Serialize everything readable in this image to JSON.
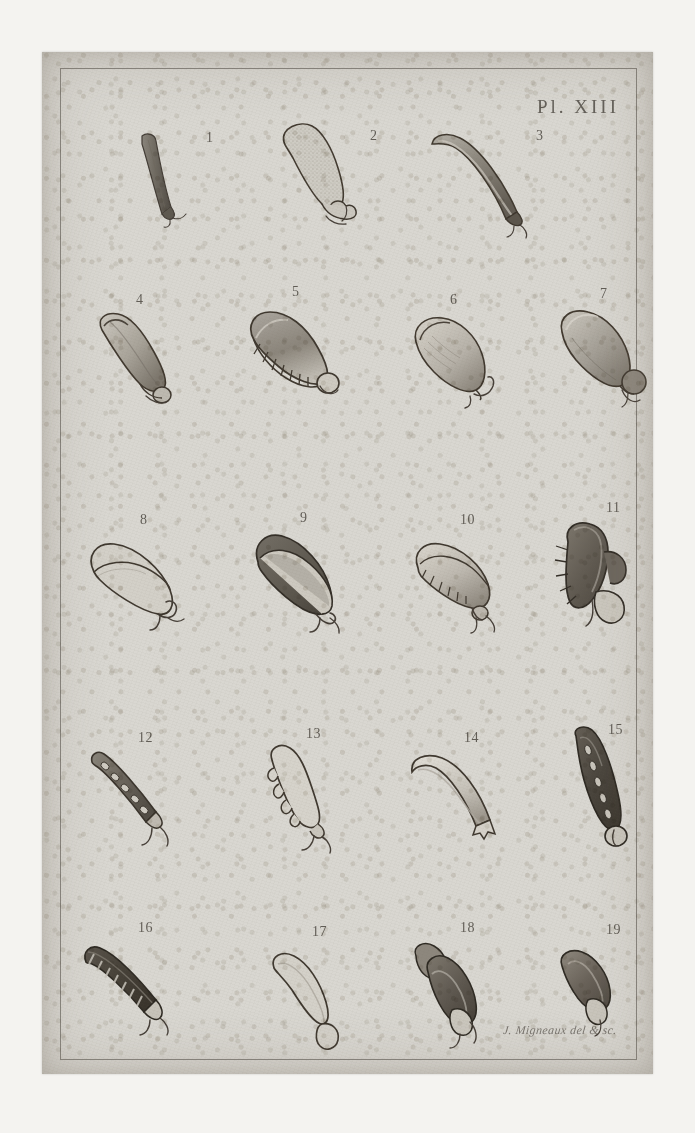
{
  "plate": {
    "label": "Pl. XIII",
    "signature": "J. Migneaux del & sc.",
    "paper_color": "#d9d7d1",
    "ink_color": "#463f38",
    "border": "engraved single-rule frame"
  },
  "figures": [
    {
      "number": "1",
      "row": 1,
      "col": 1,
      "kind": "elongated-straight-pod",
      "tone": "dark",
      "desc": "narrow elongated dark pod, slightly tapered, small forked hilum at base"
    },
    {
      "number": "2",
      "row": 1,
      "col": 2,
      "kind": "elongated-oval-seed",
      "tone": "light",
      "desc": "pale stippled elongated oval seed with knobbed hilum at base"
    },
    {
      "number": "3",
      "row": 1,
      "col": 3,
      "kind": "curved-elongated-pod",
      "tone": "medium",
      "desc": "curved elongated shaded pod with small forked appendage"
    },
    {
      "number": "4",
      "row": 2,
      "col": 1,
      "kind": "tapered-oblong-seed",
      "tone": "light",
      "desc": "tapered oblong seed, shaded right flank, rounded hilum lobe"
    },
    {
      "number": "5",
      "row": 2,
      "col": 2,
      "kind": "toothed-oblong-seed",
      "tone": "medium",
      "desc": "oblong seed with serrated comb-like ridge along lower margin, round hilum"
    },
    {
      "number": "6",
      "row": 2,
      "col": 3,
      "kind": "pear-shaped-seed",
      "tone": "light",
      "desc": "pear/ovoid seed with slender curved funicle"
    },
    {
      "number": "7",
      "row": 2,
      "col": 4,
      "kind": "ovoid-seed-with-caruncle",
      "tone": "medium",
      "desc": "ovoid seed with large rounded caruncle at base"
    },
    {
      "number": "8",
      "row": 3,
      "col": 1,
      "kind": "pointed-oval-outline",
      "tone": "outline",
      "desc": "pointed oval seed drawn in outline with looped funicle"
    },
    {
      "number": "9",
      "row": 3,
      "col": 2,
      "kind": "pointed-oval-seed",
      "tone": "dark",
      "desc": "pointed oval seed, dark filled body with pale rim, hooked base"
    },
    {
      "number": "10",
      "row": 3,
      "col": 3,
      "kind": "toothed-oval-seed",
      "tone": "light",
      "desc": "oval seed with serrated inner ridge and small basal knob"
    },
    {
      "number": "11",
      "row": 3,
      "col": 4,
      "kind": "winged-crested-seed",
      "tone": "dark",
      "desc": "complex dark crested/winged seed with spiny margin and round lobe"
    },
    {
      "number": "12",
      "row": 4,
      "col": 1,
      "kind": "segmented-narrow-pod",
      "tone": "medium",
      "desc": "narrow segmented pod with chambered interior and forked base"
    },
    {
      "number": "13",
      "row": 4,
      "col": 2,
      "kind": "lobed-pod-outline",
      "tone": "outline",
      "desc": "club-shaped pod in outline with bumpy lower margin and forked base"
    },
    {
      "number": "14",
      "row": 4,
      "col": 3,
      "kind": "curved-smooth-pod",
      "tone": "light",
      "desc": "pale smooth curved pod with squared forked base"
    },
    {
      "number": "15",
      "row": 4,
      "col": 4,
      "kind": "segmented-dark-pod",
      "tone": "dark",
      "desc": "dark elongated segmented pod with pale chambers and basal loop"
    },
    {
      "number": "16",
      "row": 5,
      "col": 1,
      "kind": "segmented-dark-pod-oblique",
      "tone": "dark",
      "desc": "oblique dark segmented pod with pale ribs and basal hook"
    },
    {
      "number": "17",
      "row": 5,
      "col": 2,
      "kind": "crescent-pod-outline",
      "tone": "light",
      "desc": "pale crescent pod with looped base"
    },
    {
      "number": "18",
      "row": 5,
      "col": 3,
      "kind": "compound-lobed-seed",
      "tone": "dark",
      "desc": "compound dark lobed seed cluster with basal appendage"
    },
    {
      "number": "19",
      "row": 5,
      "col": 4,
      "kind": "small-lobed-seed",
      "tone": "medium",
      "desc": "small dark lobed seed with rounded basal appendage"
    }
  ]
}
